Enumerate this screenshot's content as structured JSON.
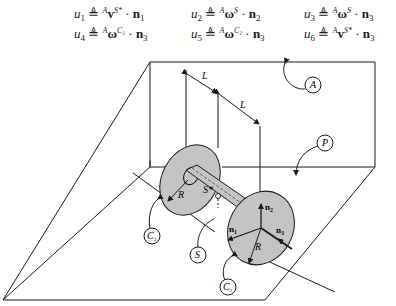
{
  "equations": [
    {
      "lhs": "u",
      "lhs_sub": "1",
      "op": "≜",
      "frame": "A",
      "vec": "v",
      "vec_sup": "S*",
      "dot": "·",
      "basis": "n",
      "basis_sub": "1"
    },
    {
      "lhs": "u",
      "lhs_sub": "2",
      "op": "≜",
      "frame": "A",
      "vec": "ω",
      "vec_sup": "S",
      "dot": "·",
      "basis": "n",
      "basis_sub": "2"
    },
    {
      "lhs": "u",
      "lhs_sub": "3",
      "op": "≜",
      "frame": "A",
      "vec": "ω",
      "vec_sup": "S",
      "dot": "·",
      "basis": "n",
      "basis_sub": "3"
    },
    {
      "lhs": "u",
      "lhs_sub": "4",
      "op": "≜",
      "frame": "A",
      "vec": "ω",
      "vec_sup": "C₁",
      "dot": "·",
      "basis": "n",
      "basis_sub": "3"
    },
    {
      "lhs": "u",
      "lhs_sub": "5",
      "op": "≜",
      "frame": "A",
      "vec": "ω",
      "vec_sup": "C₂",
      "dot": "·",
      "basis": "n",
      "basis_sub": "3"
    },
    {
      "lhs": "u",
      "lhs_sub": "6",
      "op": "≜",
      "frame": "A",
      "vec": "v",
      "vec_sup": "S*",
      "dot": "·",
      "basis": "n",
      "basis_sub": "3"
    }
  ],
  "diagram": {
    "labels": {
      "frame_A": "A",
      "plane_P": "P",
      "wheel_C1": "C",
      "wheel_C1_sub": "1",
      "wheel_C2": "C",
      "wheel_C2_sub": "2",
      "axle_S": "S",
      "mass_center": "S*",
      "radius_left": "R",
      "radius_right": "R",
      "length_1": "L",
      "length_2": "L",
      "n1": "n",
      "n1_sub": "1",
      "n2": "n",
      "n2_sub": "2",
      "n3": "n",
      "n3_sub": "3"
    },
    "colors": {
      "line": "#1a1a1a",
      "disk_fill": "#c4c4c4",
      "background": "#ffffff"
    }
  }
}
